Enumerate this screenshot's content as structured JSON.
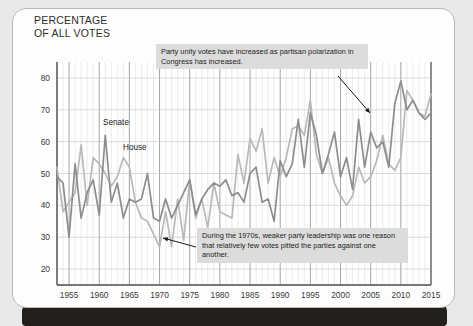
{
  "title": "PERCENTAGE\nOF ALL VOTES",
  "annotations": {
    "top": "Party unity votes have increased as partisan polarization in Congress has increased.",
    "bottom": "During the 1970s, weaker party leadership was one reason that relatively few votes pitted the parties against one another."
  },
  "series_labels": {
    "senate": "Senate",
    "house": "House"
  },
  "colors": {
    "senate": "#8d8d8d",
    "house": "#b9b9b9",
    "grid_minor": "#d9d9d9",
    "grid_major": "#8c8c8c",
    "axis": "#4a4a4a",
    "annotation_bg": "#dcdcdc"
  },
  "chart_data": {
    "type": "line",
    "title": "PERCENTAGE OF ALL VOTES",
    "xlabel": "",
    "ylabel": "PERCENTAGE OF ALL VOTES",
    "xlim": [
      1953,
      2015
    ],
    "ylim": [
      15,
      85
    ],
    "yticks": [
      20,
      30,
      40,
      50,
      60,
      70,
      80
    ],
    "xticks": [
      1955,
      1960,
      1965,
      1970,
      1975,
      1980,
      1985,
      1990,
      1995,
      2000,
      2005,
      2010,
      2015
    ],
    "grid": "vertical yearly minor, 5-year major; horizontal at yticks",
    "legend": "inline labels on plot",
    "x": [
      1953,
      1954,
      1955,
      1956,
      1957,
      1958,
      1959,
      1960,
      1961,
      1962,
      1963,
      1964,
      1965,
      1966,
      1967,
      1968,
      1969,
      1970,
      1971,
      1972,
      1973,
      1974,
      1975,
      1976,
      1977,
      1978,
      1979,
      1980,
      1981,
      1982,
      1983,
      1984,
      1985,
      1986,
      1987,
      1988,
      1989,
      1990,
      1991,
      1992,
      1993,
      1994,
      1995,
      1996,
      1997,
      1998,
      1999,
      2000,
      2001,
      2002,
      2003,
      2004,
      2005,
      2006,
      2007,
      2008,
      2009,
      2010,
      2011,
      2012,
      2013,
      2014,
      2015
    ],
    "series": [
      {
        "name": "Senate",
        "values": [
          49,
          47,
          30,
          53,
          36,
          44,
          48,
          37,
          62,
          41,
          47,
          36,
          42,
          41,
          42,
          50,
          36,
          35,
          42,
          36,
          40,
          44,
          48,
          37,
          42,
          45,
          47,
          46,
          48,
          43,
          44,
          41,
          50,
          52,
          41,
          42,
          35,
          54,
          49,
          53,
          67,
          52,
          69,
          62,
          50,
          56,
          63,
          49,
          55,
          45,
          67,
          52,
          63,
          58,
          60,
          52,
          72,
          79,
          70,
          73,
          69,
          67,
          69
        ],
        "color": "#8d8d8d"
      },
      {
        "name": "House",
        "values": [
          52,
          38,
          41,
          44,
          59,
          40,
          55,
          53,
          50,
          46,
          49,
          55,
          52,
          41,
          36,
          35,
          31,
          27,
          38,
          27,
          42,
          29,
          48,
          36,
          42,
          33,
          47,
          38,
          37,
          36,
          56,
          47,
          61,
          57,
          64,
          47,
          55,
          49,
          55,
          64,
          65,
          62,
          73,
          56,
          50,
          55,
          47,
          43,
          40,
          43,
          52,
          47,
          49,
          54,
          62,
          53,
          51,
          55,
          76,
          73,
          69,
          68,
          75
        ],
        "color": "#b9b9b9"
      }
    ],
    "annotations": [
      {
        "text": "Party unity votes have increased as partisan polarization in Congress has increased.",
        "arrow_to_x": 1997,
        "arrow_to_y": 62
      },
      {
        "text": "During the 1970s, weaker party leadership was one reason that relatively few votes pitted the parties against one another.",
        "arrow_to_x": 1973,
        "arrow_to_y": 30
      }
    ]
  }
}
